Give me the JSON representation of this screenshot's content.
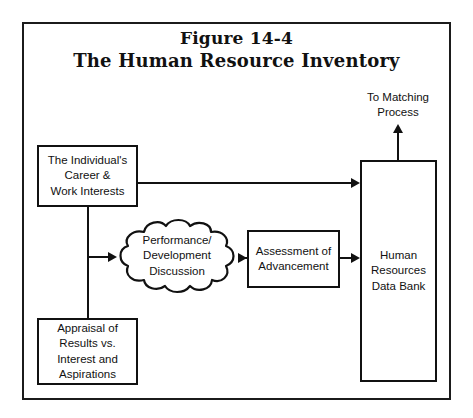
{
  "figure": {
    "title_line_1": "Figure 14-4",
    "title_line_2": "The Human Resource Inventory"
  },
  "nodes": {
    "individual": "The Individual's\nCareer &\nWork Interests",
    "appraisal": "Appraisal of\nResults vs.\nInterest and\nAspirations",
    "discussion": "Performance/\nDevelopment\nDiscussion",
    "assessment": "Assessment of\nAdvancement",
    "databank": "Human\nResources\nData Bank"
  },
  "labels": {
    "output": "To Matching\nProcess"
  },
  "colors": {
    "ink": "#111111",
    "background": "#ffffff",
    "frame": "#1b1b1b"
  }
}
